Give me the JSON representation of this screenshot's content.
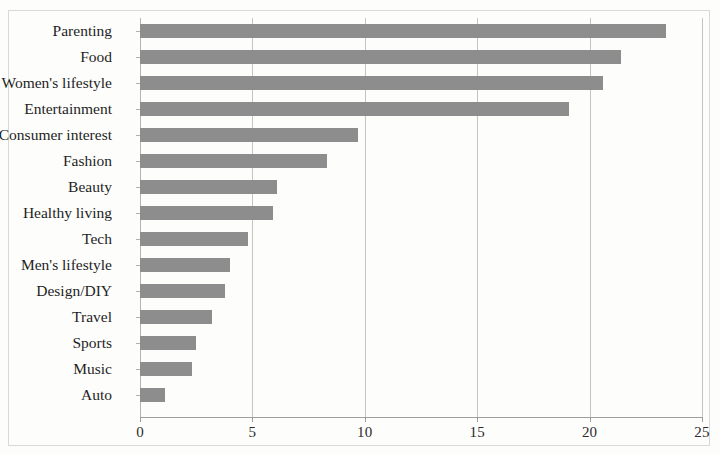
{
  "chart_data": {
    "type": "bar",
    "orientation": "horizontal",
    "title": "",
    "subtitle": "",
    "xlabel": "",
    "ylabel": "",
    "xlim": [
      0,
      25
    ],
    "xticks": [
      0,
      5,
      10,
      15,
      20,
      25
    ],
    "xtick_labels": [
      "0",
      "5",
      "10",
      "15",
      "20",
      "25"
    ],
    "grid": true,
    "grid_axis": "x",
    "legend": null,
    "bar_color": "#8d8d8d",
    "background_color": "#ffffff",
    "frame_color": "#d9d9d9",
    "categories": [
      "Parenting",
      "Food",
      "Women's lifestyle",
      "Entertainment",
      "Consumer interest",
      "Fashion",
      "Beauty",
      "Healthy living",
      "Tech",
      "Men's lifestyle",
      "Design/DIY",
      "Travel",
      "Sports",
      "Music",
      "Auto"
    ],
    "values": [
      23.4,
      21.4,
      20.6,
      19.1,
      9.7,
      8.3,
      6.1,
      5.9,
      4.8,
      4.0,
      3.8,
      3.2,
      2.5,
      2.3,
      1.1
    ]
  }
}
